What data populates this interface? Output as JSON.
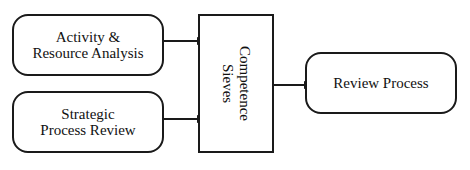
{
  "diagram": {
    "nodes": [
      {
        "id": "activity",
        "label_line1": "Activity &",
        "label_line2": "Resource Analysis",
        "shape": "rounded-rect"
      },
      {
        "id": "strategic",
        "label_line1": "Strategic",
        "label_line2": "Process Review",
        "shape": "rounded-rect"
      },
      {
        "id": "sieves",
        "label_line1": "Competence",
        "label_line2": "Sieves",
        "shape": "rect",
        "orientation": "vertical"
      },
      {
        "id": "review",
        "label": "Review Process",
        "shape": "rounded-rect"
      }
    ],
    "edges": [
      {
        "from": "activity",
        "to": "sieves"
      },
      {
        "from": "strategic",
        "to": "sieves"
      },
      {
        "from": "sieves",
        "to": "review"
      }
    ],
    "colors": {
      "stroke": "#1a1a1a",
      "background": "#ffffff"
    }
  }
}
